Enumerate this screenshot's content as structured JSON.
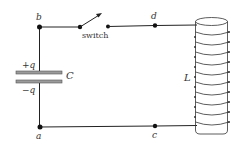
{
  "diagram": {
    "type": "LC circuit",
    "nodes": {
      "a": {
        "label": "a"
      },
      "b": {
        "label": "b"
      },
      "c": {
        "label": "c"
      },
      "d": {
        "label": "d"
      }
    },
    "capacitor": {
      "label": "C",
      "top_charge": "+q",
      "bottom_charge": "−q"
    },
    "inductor": {
      "label": "L",
      "turns": 10
    },
    "switch": {
      "label": "switch",
      "state": "open"
    },
    "colors": {
      "wire": "#222222",
      "plate_fill": "#9a9a9a",
      "text": "#333333"
    }
  }
}
